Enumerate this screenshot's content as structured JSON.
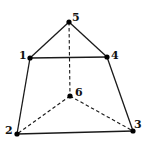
{
  "diagram": {
    "type": "graph",
    "nodes": [
      {
        "id": "1",
        "label": "1",
        "x": 30,
        "y": 58,
        "label_x": 19,
        "label_y": 50
      },
      {
        "id": "2",
        "label": "2",
        "x": 17,
        "y": 134,
        "label_x": 5,
        "label_y": 125
      },
      {
        "id": "3",
        "label": "3",
        "x": 133,
        "label_x": 134,
        "y": 131,
        "label_y": 119
      },
      {
        "id": "4",
        "label": "4",
        "x": 107,
        "y": 57,
        "label_x": 111,
        "label_y": 50
      },
      {
        "id": "5",
        "label": "5",
        "x": 69,
        "y": 22,
        "label_x": 72,
        "label_y": 12
      },
      {
        "id": "6",
        "label": "6",
        "x": 70,
        "y": 96,
        "label_x": 75,
        "label_y": 87
      }
    ],
    "edges": [
      {
        "from": "5",
        "to": "1",
        "style": "solid"
      },
      {
        "from": "5",
        "to": "4",
        "style": "solid"
      },
      {
        "from": "1",
        "to": "4",
        "style": "solid"
      },
      {
        "from": "1",
        "to": "2",
        "style": "solid"
      },
      {
        "from": "4",
        "to": "3",
        "style": "solid"
      },
      {
        "from": "2",
        "to": "3",
        "style": "solid"
      },
      {
        "from": "5",
        "to": "6",
        "style": "dashed"
      },
      {
        "from": "6",
        "to": "2",
        "style": "dashed"
      },
      {
        "from": "6",
        "to": "3",
        "style": "dashed"
      }
    ]
  }
}
